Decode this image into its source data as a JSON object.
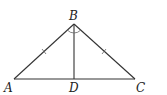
{
  "diagram": {
    "type": "geometry",
    "colors": {
      "stroke": "#333333",
      "text": "#222222",
      "background": "#ffffff"
    },
    "points": {
      "A": {
        "label": "A",
        "x": 14,
        "y": 79
      },
      "B": {
        "label": "B",
        "x": 74,
        "y": 24
      },
      "C": {
        "label": "C",
        "x": 135,
        "y": 79
      },
      "D": {
        "label": "D",
        "x": 74,
        "y": 79
      }
    },
    "segments": [
      "AB",
      "BC",
      "AC",
      "BD"
    ],
    "congruence_marks": [
      "AB",
      "BC"
    ],
    "angle_marks": [
      "ABD",
      "DBC"
    ]
  }
}
